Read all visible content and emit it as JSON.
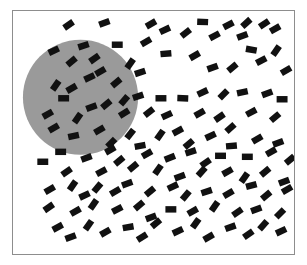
{
  "figure": {
    "canvas": {
      "width": 307,
      "height": 265,
      "background": "#ffffff"
    },
    "panel": {
      "label": "stimulus panel",
      "x": 12,
      "y": 10,
      "width": 283,
      "height": 245,
      "background": "#ffffff",
      "border_color": "#8d8d8d",
      "border_width": 1
    },
    "circle_region": {
      "label": "gray circular region",
      "shape": "circle",
      "cx": 80,
      "cy": 97,
      "r": 58,
      "fill": "#9a9a9a",
      "stroke": "none"
    },
    "elements": {
      "label": "oriented black rectangles",
      "count": 132,
      "fill": "#111111",
      "nominal_width": 11,
      "nominal_height": 6.5,
      "orientation_range_deg": [
        -90,
        90
      ]
    }
  },
  "chart_data": {
    "type": "scatter",
    "xlabel": "",
    "ylabel": "",
    "xlim": [
      12,
      295
    ],
    "ylim": [
      10,
      255
    ],
    "grid": false,
    "legend": null,
    "regions": [
      {
        "name": "gray circle",
        "shape": "circle",
        "cx": 80,
        "cy": 97,
        "r": 58,
        "color": "#9a9a9a"
      }
    ],
    "series": [
      {
        "name": "rectangle elements",
        "marker": "rotated-rectangle",
        "color": "#111111",
        "w": 11,
        "h": 6.5,
        "points": [
          [
            68,
            24,
            -35
          ],
          [
            104,
            22,
            -20
          ],
          [
            151,
            23,
            -30
          ],
          [
            203,
            21,
            2
          ],
          [
            229,
            24,
            -28
          ],
          [
            247,
            22,
            -42
          ],
          [
            265,
            23,
            -34
          ],
          [
            53,
            50,
            -25
          ],
          [
            83,
            45,
            -18
          ],
          [
            117,
            44,
            0
          ],
          [
            146,
            41,
            -30
          ],
          [
            165,
            29,
            -25
          ],
          [
            186,
            32,
            -38
          ],
          [
            215,
            35,
            -28
          ],
          [
            243,
            35,
            -20
          ],
          [
            252,
            49,
            10
          ],
          [
            276,
            28,
            -30
          ],
          [
            277,
            50,
            -55
          ],
          [
            71,
            61,
            -40
          ],
          [
            94,
            58,
            -35
          ],
          [
            100,
            71,
            -30
          ],
          [
            130,
            63,
            -55
          ],
          [
            140,
            72,
            -18
          ],
          [
            166,
            53,
            -5
          ],
          [
            195,
            55,
            -30
          ],
          [
            213,
            67,
            -20
          ],
          [
            233,
            67,
            -40
          ],
          [
            262,
            60,
            -28
          ],
          [
            287,
            70,
            -30
          ],
          [
            55,
            85,
            -55
          ],
          [
            71,
            88,
            -30
          ],
          [
            89,
            77,
            -25
          ],
          [
            116,
            82,
            -40
          ],
          [
            124,
            100,
            -50
          ],
          [
            138,
            96,
            -18
          ],
          [
            161,
            98,
            0
          ],
          [
            183,
            98,
            2
          ],
          [
            203,
            92,
            -25
          ],
          [
            224,
            94,
            -45
          ],
          [
            243,
            92,
            -12
          ],
          [
            268,
            93,
            -20
          ],
          [
            283,
            99,
            0
          ],
          [
            63,
            98,
            0
          ],
          [
            91,
            107,
            -20
          ],
          [
            106,
            104,
            -40
          ],
          [
            47,
            114,
            -30
          ],
          [
            77,
            118,
            -55
          ],
          [
            124,
            113,
            -32
          ],
          [
            149,
            112,
            -38
          ],
          [
            167,
            115,
            -25
          ],
          [
            200,
            113,
            -30
          ],
          [
            220,
            117,
            -35
          ],
          [
            231,
            128,
            -42
          ],
          [
            252,
            112,
            -28
          ],
          [
            276,
            117,
            -40
          ],
          [
            53,
            128,
            -30
          ],
          [
            73,
            136,
            -12
          ],
          [
            99,
            130,
            -30
          ],
          [
            111,
            143,
            -45
          ],
          [
            130,
            134,
            -52
          ],
          [
            140,
            146,
            -10
          ],
          [
            160,
            135,
            -55
          ],
          [
            178,
            131,
            -28
          ],
          [
            189,
            144,
            -40
          ],
          [
            211,
            136,
            -25
          ],
          [
            232,
            146,
            -5
          ],
          [
            258,
            139,
            -30
          ],
          [
            279,
            143,
            -20
          ],
          [
            60,
            152,
            0
          ],
          [
            86,
            158,
            -20
          ],
          [
            110,
            150,
            -30
          ],
          [
            119,
            161,
            -40
          ],
          [
            147,
            154,
            -30
          ],
          [
            170,
            158,
            -22
          ],
          [
            191,
            152,
            -18
          ],
          [
            206,
            163,
            -35
          ],
          [
            221,
            156,
            0
          ],
          [
            248,
            157,
            0
          ],
          [
            272,
            152,
            -30
          ],
          [
            291,
            160,
            -40
          ],
          [
            42,
            162,
            0
          ],
          [
            66,
            172,
            -35
          ],
          [
            101,
            172,
            -28
          ],
          [
            133,
            167,
            -40
          ],
          [
            158,
            170,
            -55
          ],
          [
            180,
            177,
            -20
          ],
          [
            202,
            172,
            -48
          ],
          [
            228,
            172,
            -30
          ],
          [
            245,
            178,
            -55
          ],
          [
            266,
            172,
            -40
          ],
          [
            285,
            182,
            -20
          ],
          [
            49,
            190,
            -30
          ],
          [
            72,
            186,
            -55
          ],
          [
            84,
            196,
            -25
          ],
          [
            97,
            188,
            -50
          ],
          [
            115,
            192,
            -30
          ],
          [
            127,
            184,
            -20
          ],
          [
            150,
            192,
            -40
          ],
          [
            173,
            187,
            -25
          ],
          [
            186,
            196,
            -50
          ],
          [
            207,
            192,
            -18
          ],
          [
            229,
            194,
            -30
          ],
          [
            252,
            186,
            -15
          ],
          [
            267,
            196,
            -40
          ],
          [
            288,
            190,
            -30
          ],
          [
            48,
            208,
            -35
          ],
          [
            75,
            212,
            -30
          ],
          [
            93,
            205,
            -55
          ],
          [
            117,
            210,
            -28
          ],
          [
            139,
            206,
            -40
          ],
          [
            151,
            218,
            -20
          ],
          [
            171,
            210,
            0
          ],
          [
            193,
            212,
            -30
          ],
          [
            215,
            207,
            -55
          ],
          [
            238,
            213,
            -35
          ],
          [
            257,
            210,
            -20
          ],
          [
            281,
            214,
            -45
          ],
          [
            57,
            228,
            -28
          ],
          [
            70,
            238,
            -20
          ],
          [
            88,
            226,
            -55
          ],
          [
            105,
            233,
            -30
          ],
          [
            128,
            228,
            -10
          ],
          [
            142,
            238,
            -32
          ],
          [
            156,
            224,
            -40
          ],
          [
            178,
            232,
            -25
          ],
          [
            196,
            224,
            -55
          ],
          [
            209,
            238,
            -30
          ],
          [
            231,
            228,
            -20
          ],
          [
            249,
            235,
            -35
          ],
          [
            264,
            226,
            -48
          ],
          [
            282,
            232,
            -25
          ]
        ]
      }
    ]
  }
}
